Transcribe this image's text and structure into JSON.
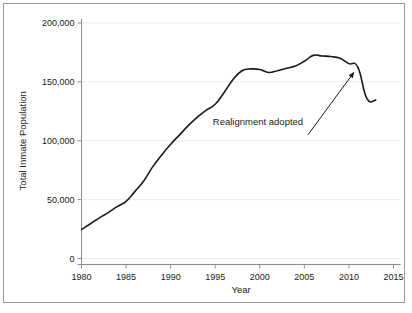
{
  "chart_data": {
    "type": "line",
    "title": "",
    "xlabel": "Year",
    "ylabel": "Total Inmate Population",
    "xlim": [
      1978.5,
      2015.8
    ],
    "ylim": [
      0,
      208000
    ],
    "grid": true,
    "legend": false,
    "legend_position": "none",
    "xticks": [
      1980,
      1985,
      1990,
      1995,
      2000,
      2005,
      2010,
      2015
    ],
    "xtick_labels": [
      "1980",
      "1985",
      "1990",
      "1995",
      "2000",
      "2005",
      "2010",
      "2015"
    ],
    "yticks": [
      0,
      50000,
      100000,
      150000,
      200000
    ],
    "ytick_labels": [
      "0",
      "50,000",
      "100,000",
      "150,000",
      "200,000"
    ],
    "series": [
      {
        "name": "Total Inmate Population",
        "color": "#1a1a1a",
        "x": [
          1980,
          1981,
          1982,
          1983,
          1984,
          1985,
          1986,
          1987,
          1988,
          1989,
          1990,
          1991,
          1992,
          1993,
          1994,
          1995,
          1996,
          1997,
          1998,
          1999,
          2000,
          2001,
          2002,
          2003,
          2004,
          2005,
          2006,
          2007,
          2008,
          2009,
          2010,
          2011,
          2012,
          2013
        ],
        "values": [
          24500,
          29500,
          34500,
          39000,
          44000,
          48500,
          57000,
          66000,
          78000,
          88000,
          97000,
          105000,
          113000,
          120000,
          126000,
          131000,
          141000,
          152000,
          159500,
          161000,
          160500,
          158000,
          159500,
          161500,
          163500,
          167500,
          172500,
          172000,
          171500,
          170000,
          165500,
          162500,
          136000,
          134500
        ]
      }
    ],
    "annotations": [
      {
        "text": "Realignment adopted",
        "text_x": 1999.8,
        "text_y": 113000,
        "arrow_from_x": 2005.4,
        "arrow_from_y": 105000,
        "arrow_to_x": 2010.6,
        "arrow_to_y": 158500
      }
    ]
  },
  "axes": {
    "ylabel": "Total Inmate Population",
    "xlabel": "Year"
  }
}
